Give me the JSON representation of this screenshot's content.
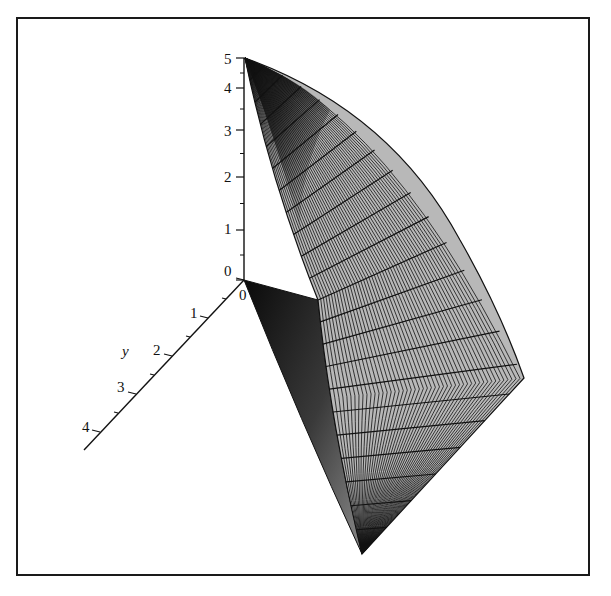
{
  "chart_data": {
    "type": "surface3d",
    "title": "",
    "axes": {
      "z": {
        "label": "",
        "range": [
          0,
          5
        ],
        "ticks": [
          "0",
          "1",
          "2",
          "3",
          "4",
          "5"
        ]
      },
      "y": {
        "label": "y",
        "range": [
          0,
          4
        ],
        "ticks": [
          "0",
          "1",
          "2",
          "3",
          "4"
        ]
      },
      "x": {
        "label": "",
        "ticks": []
      }
    },
    "surface": {
      "style": "patch with grid lines",
      "fill_color": "#b8b8b8",
      "line_color": "#111111",
      "apex_point": {
        "y": 0,
        "z": 5
      },
      "origin_point": {
        "y": 0,
        "z": 0
      }
    },
    "grid": false,
    "legend": null,
    "frame": "boxed"
  },
  "labels": {
    "z_ticks": [
      "0",
      "1",
      "2",
      "3",
      "4",
      "5"
    ],
    "y_ticks": [
      "0",
      "1",
      "2",
      "3",
      "4"
    ],
    "y_axis_title": "y"
  },
  "colors": {
    "surface_fill": "#b8b8b8",
    "surface_dark": "#1c1c1c",
    "mesh_line": "#111111",
    "frame": "#1a1a1a",
    "background": "#ffffff"
  }
}
